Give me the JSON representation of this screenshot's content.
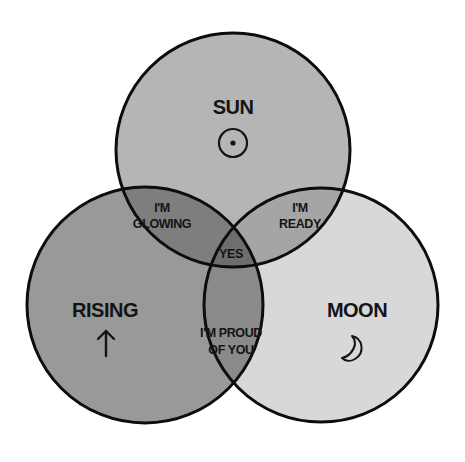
{
  "diagram": {
    "type": "venn",
    "sets": [
      {
        "id": "sun",
        "label": "SUN",
        "icon": "sun-symbol-icon",
        "fill": "#b5b5b5",
        "cx": 233,
        "cy": 150,
        "r": 117
      },
      {
        "id": "rising",
        "label": "RISING",
        "icon": "up-arrow-icon",
        "fill": "#999999",
        "cx": 145,
        "cy": 305,
        "r": 118
      },
      {
        "id": "moon",
        "label": "MOON",
        "icon": "crescent-moon-icon",
        "fill": "#d8d8d8",
        "cx": 321,
        "cy": 305,
        "r": 117
      }
    ],
    "intersections": {
      "sun_rising": {
        "line1": "I'M",
        "line2": "GLOWING",
        "fill": "#7e7e7e"
      },
      "sun_moon": {
        "line1": "I'M",
        "line2": "READY",
        "fill": "#a5a5a5"
      },
      "rising_moon": {
        "line1": "I'M PROUD",
        "line2": "OF YOU",
        "fill": "#8a8a8a"
      },
      "all": {
        "label": "YES",
        "fill": "#6e6e6e"
      }
    },
    "stroke": "#0d0d0d"
  }
}
